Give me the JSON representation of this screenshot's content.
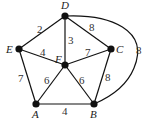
{
  "graph": {
    "vertices": [
      {
        "id": "D",
        "label": "D",
        "x": 65,
        "y": 16
      },
      {
        "id": "E",
        "label": "E",
        "x": 19,
        "y": 49
      },
      {
        "id": "F",
        "label": "F",
        "x": 65,
        "y": 65
      },
      {
        "id": "C",
        "label": "C",
        "x": 111,
        "y": 49
      },
      {
        "id": "A",
        "label": "A",
        "x": 36,
        "y": 104
      },
      {
        "id": "B",
        "label": "B",
        "x": 94,
        "y": 104
      }
    ],
    "edges": [
      {
        "from": "D",
        "to": "E",
        "weight": "2"
      },
      {
        "from": "D",
        "to": "F",
        "weight": "3"
      },
      {
        "from": "D",
        "to": "C",
        "weight": "8"
      },
      {
        "from": "D",
        "to": "B",
        "weight": "8",
        "curved": true
      },
      {
        "from": "E",
        "to": "F",
        "weight": "4"
      },
      {
        "from": "F",
        "to": "C",
        "weight": "7"
      },
      {
        "from": "E",
        "to": "A",
        "weight": "7"
      },
      {
        "from": "F",
        "to": "A",
        "weight": "6"
      },
      {
        "from": "F",
        "to": "B",
        "weight": "6"
      },
      {
        "from": "C",
        "to": "B",
        "weight": "8"
      },
      {
        "from": "A",
        "to": "B",
        "weight": "4"
      }
    ]
  }
}
